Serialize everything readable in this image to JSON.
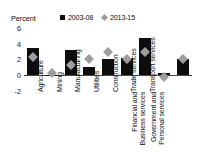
{
  "axis_unit_label": "Percent",
  "legend": [
    {
      "label": "2003-08",
      "marker": "square-marker",
      "color": "#0d0d0d"
    },
    {
      "label": "2013-15",
      "marker": "diamond-marker",
      "color": "#9d9d9d"
    }
  ],
  "yticks": [
    "6",
    "4",
    "2",
    "0",
    "-2"
  ],
  "chart_data": {
    "type": "bar",
    "title": "",
    "subtitle": "",
    "xlabel": "",
    "ylabel": "Percent",
    "ylim": [
      -2,
      6
    ],
    "ytick_values": [
      6,
      4,
      2,
      0,
      -2
    ],
    "grid": false,
    "legend_position": "top",
    "categories": [
      "Agriculture",
      "Mining",
      "Manufacturing",
      "Utilities",
      "Construction",
      "Trade services",
      "Transport services",
      "Financial and Business services",
      "Government and Personal services"
    ],
    "series": [
      {
        "name": "2003-08",
        "type": "bar",
        "color": "#0d0d0d",
        "values": [
          3.4,
          0.05,
          3.2,
          1.0,
          2.1,
          2.2,
          4.7,
          0.25,
          2.1
        ]
      },
      {
        "name": "2013-15",
        "type": "marker",
        "color": "#9d9d9d",
        "values": [
          2.3,
          0.2,
          1.3,
          2.0,
          2.9,
          2.0,
          2.9,
          -0.3,
          2.1
        ]
      }
    ]
  }
}
